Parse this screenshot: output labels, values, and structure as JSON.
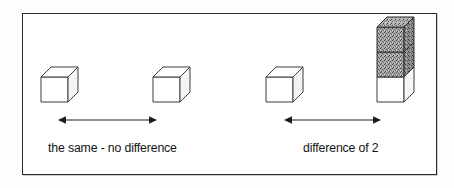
{
  "figure": {
    "type": "comparison-diagram",
    "title": "",
    "frame": {
      "border_color": "#2b2b2b",
      "background_color": "#ffffff"
    }
  },
  "colors": {
    "ink": "#141414",
    "outline": "#3a3a3a",
    "cube_fill": "#ffffff",
    "cube_shade_side": "#f2f2f2",
    "shaded_cube_fill": "#9a9a9a",
    "shaded_cube_top": "#a8a8a8",
    "shaded_cube_side": "#7d7d7d",
    "frame_border": "#2b2b2b"
  },
  "groups": [
    {
      "id": "left-pair",
      "caption": "the same - no difference",
      "difference_value": 0,
      "towers": [
        {
          "id": "left-tower-a",
          "white_cubes": 1,
          "shaded_cubes": 0,
          "total_cubes": 1
        },
        {
          "id": "left-tower-b",
          "white_cubes": 1,
          "shaded_cubes": 0,
          "total_cubes": 1
        }
      ],
      "arrow": {
        "id": "left-arrow",
        "style": "double-headed",
        "label": ""
      }
    },
    {
      "id": "right-pair",
      "caption": "difference of 2",
      "difference_value": 2,
      "towers": [
        {
          "id": "right-tower-a",
          "white_cubes": 1,
          "shaded_cubes": 0,
          "total_cubes": 1
        },
        {
          "id": "right-tower-b",
          "white_cubes": 1,
          "shaded_cubes": 2,
          "total_cubes": 3
        }
      ],
      "arrow": {
        "id": "right-arrow",
        "style": "double-headed",
        "label": ""
      }
    }
  ],
  "captions": {
    "left": "the same - no difference",
    "right": "difference of 2"
  },
  "icons": {
    "cube": "cube-icon",
    "shaded_cube": "shaded-cube-icon",
    "double_arrow": "double-headed-arrow-icon"
  }
}
